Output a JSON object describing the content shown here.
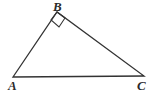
{
  "figure": {
    "kind": "geometry-diagram",
    "shape": "right-triangle",
    "background_color": "#ffffff",
    "stroke_color": "#333333",
    "stroke_width": 1.3,
    "label_color": "#2b2b2b",
    "width": 157,
    "height": 95
  },
  "vertices": [
    {
      "id": "A",
      "label": "A",
      "x": 13,
      "y": 77,
      "label_x": 8,
      "label_y": 79
    },
    {
      "id": "B",
      "label": "B",
      "x": 57,
      "y": 12,
      "label_x": 53,
      "label_y": 0
    },
    {
      "id": "C",
      "label": "C",
      "x": 144,
      "y": 76,
      "label_x": 137,
      "label_y": 79
    }
  ],
  "edges": [
    {
      "id": "AB",
      "from": "A",
      "to": "B"
    },
    {
      "id": "BC",
      "from": "B",
      "to": "C"
    },
    {
      "id": "AC",
      "from": "A",
      "to": "C"
    }
  ],
  "angle_markers": [
    {
      "id": "right-angle-B",
      "at_vertex": "B",
      "type": "right-angle-square",
      "measure": "90",
      "size": 10,
      "points": "57,12 65,18 59,27 51,20"
    }
  ],
  "polyline": {
    "triangle_points": "13,77 57,12 144,76 13,77"
  }
}
